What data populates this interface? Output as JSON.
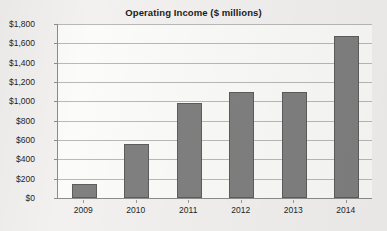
{
  "chart_data": {
    "type": "bar",
    "title": "Operating Income ($ millions)",
    "xlabel": "",
    "ylabel": "",
    "categories": [
      "2009",
      "2010",
      "2011",
      "2012",
      "2013",
      "2014"
    ],
    "values": [
      150,
      560,
      980,
      1100,
      1100,
      1680
    ],
    "series": [
      {
        "name": "Operating Income",
        "values": [
          150,
          560,
          980,
          1100,
          1100,
          1680
        ]
      }
    ],
    "ylim": [
      0,
      1800
    ],
    "ytick_values": [
      0,
      200,
      400,
      600,
      800,
      1000,
      1200,
      1400,
      1600,
      1800
    ],
    "ytick_labels": [
      "$0",
      "$200",
      "$400",
      "$600",
      "$800",
      "$1,000",
      "$1,200",
      "$1,400",
      "$1,600",
      "$1,800"
    ],
    "xtick_labels": [
      "2009",
      "2010",
      "2011",
      "2012",
      "2013",
      "2014"
    ],
    "grid": true,
    "grid_axis": "y",
    "legend": false,
    "legend_position": "none",
    "bar_color": "#808080",
    "bar_edge_color": "#5d5d5d",
    "gridline_color": "#b9b9b9",
    "axis_color": "#8c8c8c",
    "plot_background": "#fbfbfa",
    "figure_background": "#f2f1ef",
    "text_color": "#1f1f1f"
  }
}
